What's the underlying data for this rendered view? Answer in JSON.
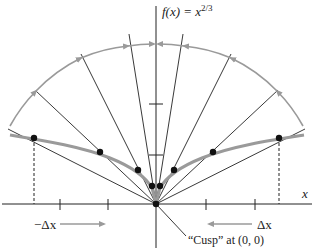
{
  "diagram": {
    "title": "f(x) = x",
    "title_exponent": "2/3",
    "x_axis_label": "x",
    "left_delta_label": "−Δx",
    "right_delta_label": "Δx",
    "cusp_annotation": "“Cusp” at (0, 0)",
    "colors": {
      "curve": "#9a9a9a",
      "arc": "#9a9a9a",
      "lines": "#222222",
      "points": "#111111"
    },
    "secant_points": [
      {
        "side": "left",
        "x": 34,
        "y": 138
      },
      {
        "side": "left",
        "x": 100,
        "y": 152
      },
      {
        "side": "left",
        "x": 138,
        "y": 170
      },
      {
        "side": "left",
        "x": 152,
        "y": 186
      },
      {
        "side": "right",
        "x": 160,
        "y": 186
      },
      {
        "side": "right",
        "x": 174,
        "y": 170
      },
      {
        "side": "right",
        "x": 213,
        "y": 152
      },
      {
        "side": "right",
        "x": 279,
        "y": 138
      }
    ]
  }
}
